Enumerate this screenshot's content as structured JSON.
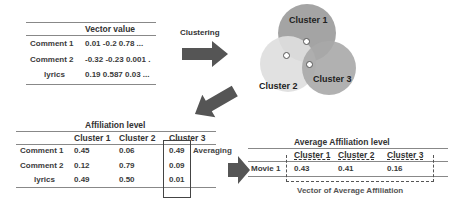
{
  "vector_table": {
    "header": "Vector value",
    "rows": [
      {
        "label": "Comment 1",
        "value": "0.01 -0.2 0.78 ..."
      },
      {
        "label": "Comment 2",
        "value": "-0.32 -0.23 0.001 ."
      },
      {
        "label": "lyrics",
        "value": "0.19 0.587 0.03 ..."
      }
    ]
  },
  "clustering_step": {
    "label": "Clustering"
  },
  "clusters": {
    "items": [
      {
        "label": "Cluster 1",
        "color": "#9a9a9a"
      },
      {
        "label": "Cluster 2",
        "color": "#d9d9d9"
      },
      {
        "label": "Cluster 3",
        "color": "#a8a8a8"
      }
    ]
  },
  "affiliation_table": {
    "title": "Affiliation level",
    "columns": [
      "Cluster 1",
      "Cluster 2",
      "Cluster 3"
    ],
    "rows": [
      {
        "label": "Comment 1",
        "values": [
          "0.45",
          "0.06",
          "0.49"
        ]
      },
      {
        "label": "Comment 2",
        "values": [
          "0.12",
          "0.79",
          "0.09"
        ]
      },
      {
        "label": "lyrics",
        "values": [
          "0.49",
          "0.50",
          "0.01"
        ]
      }
    ]
  },
  "averaging_step": {
    "label": "Averaging"
  },
  "average_table": {
    "title": "Average Affiliation level",
    "columns": [
      "Cluster 1",
      "Cluster 2",
      "Cluster 3"
    ],
    "rows": [
      {
        "label": "Movie 1",
        "values": [
          "0.43",
          "0.41",
          "0.16"
        ]
      }
    ],
    "caption": "Vector of Average Affiliation"
  },
  "colors": {
    "arrow": "#555555",
    "rule": "#888888",
    "text": "#333333"
  }
}
